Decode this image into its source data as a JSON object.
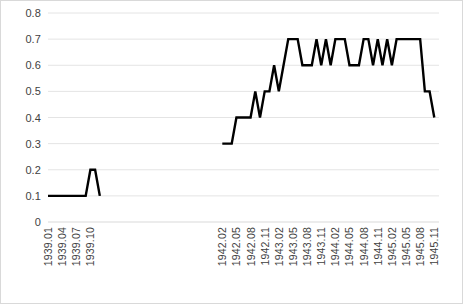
{
  "chart_data": {
    "type": "line",
    "title": "",
    "subtitle": "",
    "xlabel": "",
    "ylabel": "",
    "ylim": [
      0,
      0.8
    ],
    "ytick_labels": [
      "0",
      "0.1",
      "0.2",
      "0.3",
      "0.4",
      "0.5",
      "0.6",
      "0.7",
      "0.8"
    ],
    "ytick_values": [
      0,
      0.1,
      0.2,
      0.3,
      0.4,
      0.5,
      0.6,
      0.7,
      0.8
    ],
    "grid": true,
    "grid_axis": "y",
    "legend": false,
    "legend_position": "none",
    "line_color": "#000000",
    "line_width": 2.4,
    "grid_color": "#e4e4e4",
    "axis_color": "#d9d9d9",
    "text_color": "#3f3f3f",
    "xtick_labels": [
      "1939.01",
      "1939.04",
      "1939.07",
      "1939.10",
      "1942.02",
      "1942.05",
      "1942.08",
      "1942.11",
      "1943.02",
      "1943.05",
      "1943.08",
      "1943.11",
      "1944.02",
      "1944.05",
      "1944.08",
      "1944.11",
      "1945.02",
      "1945.05",
      "1945.08",
      "1945.11"
    ],
    "xtick_index": [
      0,
      3,
      6,
      9,
      37,
      40,
      43,
      46,
      49,
      52,
      55,
      58,
      61,
      64,
      67,
      70,
      73,
      76,
      79,
      82
    ],
    "x": [
      "1939.01",
      "1939.02",
      "1939.03",
      "1939.04",
      "1939.05",
      "1939.06",
      "1939.07",
      "1939.08",
      "1939.09",
      "1939.10",
      "1939.11",
      "1939.12",
      "1940.01",
      "1940.02",
      "1940.03",
      "1940.04",
      "1940.05",
      "1940.06",
      "1940.07",
      "1940.08",
      "1940.09",
      "1940.10",
      "1940.11",
      "1940.12",
      "1941.01",
      "1941.02",
      "1941.03",
      "1941.04",
      "1941.05",
      "1941.06",
      "1941.07",
      "1941.08",
      "1941.09",
      "1941.10",
      "1941.11",
      "1941.12",
      "1942.01",
      "1942.02",
      "1942.03",
      "1942.04",
      "1942.05",
      "1942.06",
      "1942.07",
      "1942.08",
      "1942.09",
      "1942.10",
      "1942.11",
      "1942.12",
      "1943.01",
      "1943.02",
      "1943.03",
      "1943.04",
      "1943.05",
      "1943.06",
      "1943.07",
      "1943.08",
      "1943.09",
      "1943.10",
      "1943.11",
      "1943.12",
      "1944.01",
      "1944.02",
      "1944.03",
      "1944.04",
      "1944.05",
      "1944.06",
      "1944.07",
      "1944.08",
      "1944.09",
      "1944.10",
      "1944.11",
      "1944.12",
      "1945.01",
      "1945.02",
      "1945.03",
      "1945.04",
      "1945.05",
      "1945.06",
      "1945.07",
      "1945.08",
      "1945.09",
      "1945.10",
      "1945.11",
      "1945.12"
    ],
    "values": [
      0.1,
      0.1,
      0.1,
      0.1,
      0.1,
      0.1,
      0.1,
      0.1,
      0.1,
      0.2,
      0.2,
      0.1,
      null,
      null,
      null,
      null,
      null,
      null,
      null,
      null,
      null,
      null,
      null,
      null,
      null,
      null,
      null,
      null,
      null,
      null,
      null,
      null,
      null,
      null,
      null,
      null,
      null,
      0.3,
      0.3,
      0.3,
      0.4,
      0.4,
      0.4,
      0.4,
      0.5,
      0.4,
      0.5,
      0.5,
      0.6,
      0.5,
      0.6,
      0.7,
      0.7,
      0.7,
      0.6,
      0.6,
      0.6,
      0.7,
      0.6,
      0.7,
      0.6,
      0.7,
      0.7,
      0.7,
      0.6,
      0.6,
      0.6,
      0.7,
      0.7,
      0.6,
      0.7,
      0.6,
      0.7,
      0.6,
      0.7,
      0.7,
      0.7,
      0.7,
      0.7,
      0.7,
      0.5,
      0.5,
      0.4,
      null
    ]
  }
}
